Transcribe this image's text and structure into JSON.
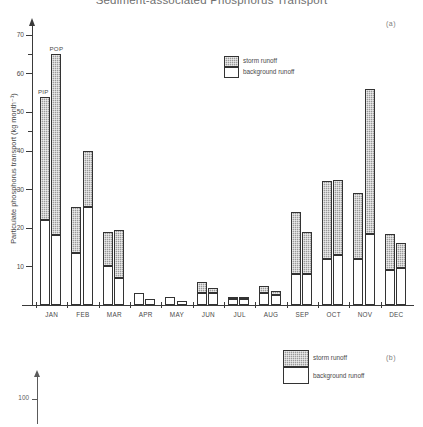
{
  "figure": {
    "title": "Sediment-associated Phosphorus Transport",
    "panel_a_label": "(a)",
    "panel_b_label": "(b)"
  },
  "legend_a": {
    "storm_label": "storm runoff",
    "background_label": "background runoff"
  },
  "legend_b": {
    "storm_label": "storm runoff",
    "background_label": "background runoff"
  },
  "panel_b": {
    "axis_tick_label": "100"
  },
  "bar_tags": {
    "pip": "PIP",
    "pop": "POP"
  },
  "colors": {
    "storm_runoff": "#9a9a9a",
    "background_runoff": "#ffffff",
    "axis": "#3a3a3a",
    "text": "#4a4a4a"
  },
  "chart_data": {
    "type": "bar",
    "title": "Sediment-associated Phosphorus Transport",
    "subtitle": "(a)",
    "xlabel": "",
    "ylabel": "Particulate phosphorus transport (kg  month⁻¹)",
    "ylim": [
      0,
      72
    ],
    "yticks": [
      10,
      20,
      30,
      40,
      50,
      60,
      70
    ],
    "ytick_labels": [
      "10",
      "20",
      "30",
      "40",
      "50",
      "60",
      "70"
    ],
    "grid": false,
    "stacked": true,
    "legend_position": "upper-center",
    "categories": [
      "JAN",
      "FEB",
      "MAR",
      "APR",
      "MAY",
      "JUN",
      "JUL",
      "AUG",
      "SEP",
      "OCT",
      "NOV",
      "DEC"
    ],
    "group_labels": [
      "PIP",
      "POP"
    ],
    "legend_entries": [
      "storm runoff",
      "background runoff"
    ],
    "series": [
      {
        "name": "PIP - background runoff",
        "fraction": "PIP",
        "component": "background runoff",
        "values": [
          22.0,
          13.5,
          10.0,
          3.0,
          2.0,
          3.0,
          1.5,
          3.0,
          8.0,
          12.0,
          12.0,
          9.0
        ]
      },
      {
        "name": "PIP - storm runoff",
        "fraction": "PIP",
        "component": "storm runoff",
        "values": [
          32.0,
          12.0,
          9.0,
          0.0,
          0.0,
          3.0,
          0.5,
          2.0,
          16.0,
          20.0,
          17.0,
          9.5
        ]
      },
      {
        "name": "PIP - total",
        "fraction": "PIP",
        "component": "total",
        "values": [
          54.0,
          25.5,
          19.0,
          3.0,
          2.0,
          6.0,
          2.0,
          5.0,
          24.0,
          32.0,
          29.0,
          18.5
        ]
      },
      {
        "name": "POP - background runoff",
        "fraction": "POP",
        "component": "background runoff",
        "values": [
          18.0,
          25.5,
          7.0,
          1.5,
          1.0,
          3.0,
          1.5,
          2.5,
          8.0,
          13.0,
          18.5,
          9.5
        ]
      },
      {
        "name": "POP - storm runoff",
        "fraction": "POP",
        "component": "storm runoff",
        "values": [
          47.0,
          14.5,
          12.5,
          0.0,
          0.0,
          1.5,
          0.5,
          1.0,
          11.0,
          19.5,
          37.5,
          6.5
        ]
      },
      {
        "name": "POP - total",
        "fraction": "POP",
        "component": "total",
        "values": [
          65.0,
          40.0,
          19.5,
          1.5,
          1.0,
          4.5,
          2.0,
          3.5,
          19.0,
          32.5,
          56.0,
          16.0
        ]
      }
    ]
  }
}
